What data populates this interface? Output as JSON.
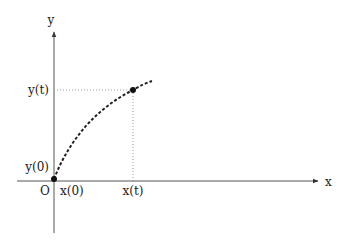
{
  "diagram": {
    "axes": {
      "x_label": "x",
      "y_label": "y",
      "origin_label": "O"
    },
    "ticks": {
      "x0": "x(0)",
      "xt": "x(t)",
      "y0": "y(0)",
      "yt": "y(t)"
    },
    "curve": {
      "style": "dashed",
      "color": "#222222",
      "points": [
        "start at (x(0), y(0))",
        "point at (x(t), y(t))"
      ]
    },
    "guide_lines": {
      "style": "dotted",
      "color": "#999999"
    }
  }
}
